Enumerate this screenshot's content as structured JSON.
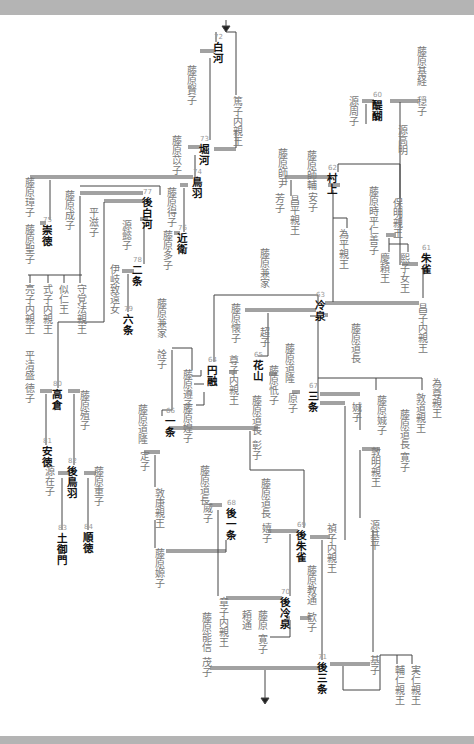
{
  "diagram": {
    "type": "imperial genealogy (vertical Japanese text)",
    "arrows": [
      "top-entry-arrow",
      "bottom-exit-arrow"
    ],
    "emperors": [
      {
        "num": "60",
        "name": "醍醐",
        "x": 375,
        "y": 100
      },
      {
        "num": "61",
        "name": "朱雀",
        "x": 424,
        "y": 253
      },
      {
        "num": "62",
        "name": "村上",
        "x": 330,
        "y": 173
      },
      {
        "num": "63",
        "name": "冷泉",
        "x": 318,
        "y": 300
      },
      {
        "num": "64",
        "name": "円融",
        "x": 210,
        "y": 365
      },
      {
        "num": "65",
        "name": "花山",
        "x": 256,
        "y": 360
      },
      {
        "num": "66",
        "name": "一条",
        "x": 168,
        "y": 416
      },
      {
        "num": "67",
        "name": "三条",
        "x": 311,
        "y": 391
      },
      {
        "num": "68",
        "name": "後一条",
        "x": 229,
        "y": 508
      },
      {
        "num": "69",
        "name": "後朱雀",
        "x": 299,
        "y": 530
      },
      {
        "num": "70",
        "name": "後冷泉",
        "x": 283,
        "y": 597
      },
      {
        "num": "71",
        "name": "後三条",
        "x": 320,
        "y": 662
      },
      {
        "num": "72",
        "name": "白河",
        "x": 216,
        "y": 42
      },
      {
        "num": "73",
        "name": "堀河",
        "x": 202,
        "y": 144
      },
      {
        "num": "74",
        "name": "鳥羽",
        "x": 195,
        "y": 177
      },
      {
        "num": "75",
        "name": "崇徳",
        "x": 45,
        "y": 225
      },
      {
        "num": "76",
        "name": "近衛",
        "x": 180,
        "y": 233
      },
      {
        "num": "77",
        "name": "後白河",
        "x": 145,
        "y": 197
      },
      {
        "num": "78",
        "name": "二条",
        "x": 135,
        "y": 265
      },
      {
        "num": "79",
        "name": "六条",
        "x": 126,
        "y": 314
      },
      {
        "num": "80",
        "name": "高倉",
        "x": 55,
        "y": 389
      },
      {
        "num": "81",
        "name": "安徳",
        "x": 45,
        "y": 446
      },
      {
        "num": "82",
        "name": "後鳥羽",
        "x": 70,
        "y": 466
      },
      {
        "num": "83",
        "name": "土御門",
        "x": 60,
        "y": 533
      },
      {
        "num": "84",
        "name": "順徳",
        "x": 86,
        "y": 532
      }
    ],
    "others": [
      {
        "name": "藤原基経",
        "x": 420,
        "y": 46
      },
      {
        "name": "穏子",
        "x": 420,
        "y": 96
      },
      {
        "name": "源周子",
        "x": 352,
        "y": 96
      },
      {
        "name": "源高明",
        "x": 401,
        "y": 125
      },
      {
        "name": "保明親王",
        "x": 396,
        "y": 198
      },
      {
        "name": "藤原時平",
        "x": 372,
        "y": 186
      },
      {
        "name": "仁善子",
        "x": 372,
        "y": 225
      },
      {
        "name": "慶頼王",
        "x": 383,
        "y": 253
      },
      {
        "name": "熙子女王",
        "x": 403,
        "y": 253
      },
      {
        "name": "昌子内親王",
        "x": 421,
        "y": 303
      },
      {
        "name": "藤原師輔",
        "x": 310,
        "y": 150
      },
      {
        "name": "安子",
        "x": 311,
        "y": 192
      },
      {
        "name": "藤原師尹",
        "x": 281,
        "y": 148
      },
      {
        "name": "芳子",
        "x": 278,
        "y": 193
      },
      {
        "name": "昌平親王",
        "x": 293,
        "y": 195
      },
      {
        "name": "為平親王",
        "x": 342,
        "y": 229
      },
      {
        "name": "藤原兼家",
        "x": 263,
        "y": 248
      },
      {
        "name": "超子",
        "x": 263,
        "y": 327
      },
      {
        "name": "藤原懐子",
        "x": 234,
        "y": 303
      },
      {
        "name": "藤原兼家",
        "x": 160,
        "y": 298
      },
      {
        "name": "詮子",
        "x": 160,
        "y": 349
      },
      {
        "name": "藤原遵子",
        "x": 186,
        "y": 369
      },
      {
        "name": "藤原媓子",
        "x": 186,
        "y": 403
      },
      {
        "name": "尊子内親王",
        "x": 232,
        "y": 355
      },
      {
        "name": "藤原忯子",
        "x": 272,
        "y": 365
      },
      {
        "name": "藤原道隆",
        "x": 288,
        "y": 343
      },
      {
        "name": "原子",
        "x": 291,
        "y": 393
      },
      {
        "name": "藤原道長",
        "x": 354,
        "y": 323
      },
      {
        "name": "娍子",
        "x": 355,
        "y": 402
      },
      {
        "name": "藤原娍子",
        "x": 380,
        "y": 395
      },
      {
        "name": "敦道親王",
        "x": 419,
        "y": 393
      },
      {
        "name": "為尊親王",
        "x": 435,
        "y": 378
      },
      {
        "name": "藤原道長",
        "x": 403,
        "y": 409
      },
      {
        "name": "寛子",
        "x": 403,
        "y": 452
      },
      {
        "name": "敦明親王",
        "x": 374,
        "y": 447
      },
      {
        "name": "藤原道長",
        "x": 255,
        "y": 395
      },
      {
        "name": "彰子",
        "x": 255,
        "y": 440
      },
      {
        "name": "藤原道隆",
        "x": 141,
        "y": 404
      },
      {
        "name": "定子",
        "x": 143,
        "y": 451
      },
      {
        "name": "敦康親王",
        "x": 158,
        "y": 488
      },
      {
        "name": "藤原嫄子",
        "x": 158,
        "y": 548
      },
      {
        "name": "藤原道長",
        "x": 203,
        "y": 465
      },
      {
        "name": "威子",
        "x": 206,
        "y": 503
      },
      {
        "name": "藤原道長",
        "x": 264,
        "y": 478
      },
      {
        "name": "嬉子",
        "x": 265,
        "y": 523
      },
      {
        "name": "禎子内親王",
        "x": 330,
        "y": 523
      },
      {
        "name": "源基平",
        "x": 373,
        "y": 520
      },
      {
        "name": "藤原教通",
        "x": 310,
        "y": 565
      },
      {
        "name": "歓子",
        "x": 310,
        "y": 612
      },
      {
        "name": "章子内親王",
        "x": 222,
        "y": 597
      },
      {
        "name": "藤原",
        "x": 261,
        "y": 610
      },
      {
        "name": "頼通",
        "x": 245,
        "y": 610
      },
      {
        "name": "寛子",
        "x": 261,
        "y": 634
      },
      {
        "name": "藤原能信",
        "x": 205,
        "y": 612
      },
      {
        "name": "茂子",
        "x": 205,
        "y": 657
      },
      {
        "name": "基子",
        "x": 373,
        "y": 655
      },
      {
        "name": "輔仁親王",
        "x": 398,
        "y": 665
      },
      {
        "name": "実仁親王",
        "x": 414,
        "y": 665
      },
      {
        "name": "藤原賢子",
        "x": 190,
        "y": 65
      },
      {
        "name": "篤子内親王",
        "x": 236,
        "y": 96
      },
      {
        "name": "藤原苡子",
        "x": 175,
        "y": 135
      },
      {
        "name": "藤原璋子",
        "x": 28,
        "y": 177
      },
      {
        "name": "藤原成子",
        "x": 68,
        "y": 190
      },
      {
        "name": "平滋子",
        "x": 92,
        "y": 207
      },
      {
        "name": "藤原得子",
        "x": 170,
        "y": 187
      },
      {
        "name": "藤原聖子",
        "x": 28,
        "y": 224
      },
      {
        "name": "源懿子",
        "x": 125,
        "y": 220
      },
      {
        "name": "藤原多子",
        "x": 166,
        "y": 230
      },
      {
        "name": "伊岐致遠女",
        "x": 113,
        "y": 264
      },
      {
        "name": "亮子内親王",
        "x": 28,
        "y": 284
      },
      {
        "name": "式子内親王",
        "x": 46,
        "y": 284
      },
      {
        "name": "似仁王",
        "x": 62,
        "y": 284
      },
      {
        "name": "守覚法親王",
        "x": 80,
        "y": 284
      },
      {
        "name": "平清盛",
        "x": 28,
        "y": 350
      },
      {
        "name": "徳子",
        "x": 28,
        "y": 383
      },
      {
        "name": "藤原殖子",
        "x": 83,
        "y": 390
      },
      {
        "name": "源在子",
        "x": 48,
        "y": 466
      },
      {
        "name": "藤原重子",
        "x": 97,
        "y": 466
      }
    ]
  }
}
